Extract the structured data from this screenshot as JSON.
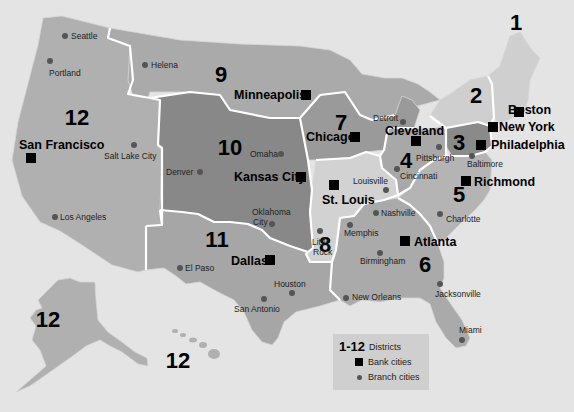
{
  "map": {
    "title_implied": "Federal Reserve Districts",
    "colors": {
      "background": "#e4e4e4",
      "d1": "#cfcfcf",
      "d2": "#cfcfcf",
      "d3": "#8a8a8a",
      "d4": "#a8a8a8",
      "d5": "#b4b4b4",
      "d6": "#aaaaaa",
      "d7": "#9a9a9a",
      "d8": "#d2d2d2",
      "d9": "#aaaaaa",
      "d10": "#888888",
      "d11": "#a6a6a6",
      "d12": "#b0b0b0",
      "border": "#ffffff",
      "bank_marker": "#000000",
      "branch_marker": "#555555"
    },
    "districts": [
      {
        "num": "1",
        "x": 516,
        "y": 30
      },
      {
        "num": "2",
        "x": 476,
        "y": 103
      },
      {
        "num": "3",
        "x": 459,
        "y": 150
      },
      {
        "num": "4",
        "x": 406,
        "y": 168
      },
      {
        "num": "5",
        "x": 459,
        "y": 202
      },
      {
        "num": "6",
        "x": 425,
        "y": 272
      },
      {
        "num": "7",
        "x": 341,
        "y": 130
      },
      {
        "num": "8",
        "x": 325,
        "y": 252
      },
      {
        "num": "9",
        "x": 221,
        "y": 82
      },
      {
        "num": "10",
        "x": 230,
        "y": 155
      },
      {
        "num": "11",
        "x": 217,
        "y": 247
      },
      {
        "num": "12",
        "x": 77,
        "y": 125
      },
      {
        "num": "12",
        "x": 48,
        "y": 327
      },
      {
        "num": "12",
        "x": 178,
        "y": 368
      }
    ],
    "bank_cities": [
      {
        "name": "Boston",
        "x": 519,
        "y": 112,
        "lx": 508,
        "ly": 114,
        "anchor": "start",
        "label_dy": 0
      },
      {
        "name": "New York",
        "x": 493,
        "y": 127,
        "lx": 499,
        "ly": 131,
        "anchor": "start"
      },
      {
        "name": "Philadelphia",
        "x": 481,
        "y": 145,
        "lx": 491,
        "ly": 149,
        "anchor": "start"
      },
      {
        "name": "Cleveland",
        "x": 416,
        "y": 141,
        "lx": 385,
        "ly": 135,
        "anchor": "start"
      },
      {
        "name": "Richmond",
        "x": 466,
        "y": 181,
        "lx": 474,
        "ly": 186,
        "anchor": "start"
      },
      {
        "name": "Atlanta",
        "x": 405,
        "y": 241,
        "lx": 414,
        "ly": 246,
        "anchor": "start"
      },
      {
        "name": "Chicago",
        "x": 355,
        "y": 137,
        "lx": 306,
        "ly": 141,
        "anchor": "start"
      },
      {
        "name": "St. Louis",
        "x": 334,
        "y": 185,
        "lx": 322,
        "ly": 204,
        "anchor": "start"
      },
      {
        "name": "Minneapolis",
        "x": 306,
        "y": 95,
        "lx": 234,
        "ly": 99,
        "anchor": "start"
      },
      {
        "name": "Kansas City",
        "x": 301,
        "y": 177,
        "lx": 234,
        "ly": 181,
        "anchor": "start"
      },
      {
        "name": "Dallas",
        "x": 270,
        "y": 260,
        "lx": 231,
        "ly": 265,
        "anchor": "start"
      },
      {
        "name": "San Francisco",
        "x": 31,
        "y": 158,
        "lx": 19,
        "ly": 149,
        "anchor": "start"
      }
    ],
    "branch_cities": [
      {
        "name": "Seattle",
        "x": 65,
        "y": 36,
        "lx": 71,
        "ly": 39
      },
      {
        "name": "Portland",
        "x": 50,
        "y": 61,
        "lx": 49,
        "ly": 76
      },
      {
        "name": "Helena",
        "x": 145,
        "y": 65,
        "lx": 151,
        "ly": 68
      },
      {
        "name": "Salt Lake City",
        "x": 134,
        "y": 145,
        "lx": 104,
        "ly": 159
      },
      {
        "name": "Los Angeles",
        "x": 55,
        "y": 217,
        "lx": 60,
        "ly": 220
      },
      {
        "name": "Denver",
        "x": 200,
        "y": 172,
        "lx": 166,
        "ly": 175
      },
      {
        "name": "Omaha",
        "x": 281,
        "y": 154,
        "lx": 250,
        "ly": 157
      },
      {
        "name": "Oklahoma City",
        "x": 272,
        "y": 224,
        "lx": 252,
        "ly": 215,
        "lx2": 253,
        "ly2": 225,
        "split": [
          "Oklahoma",
          "City"
        ]
      },
      {
        "name": "El Paso",
        "x": 180,
        "y": 268,
        "lx": 185,
        "ly": 271
      },
      {
        "name": "Houston",
        "x": 292,
        "y": 293,
        "lx": 274,
        "ly": 287
      },
      {
        "name": "San Antonio",
        "x": 264,
        "y": 299,
        "lx": 234,
        "ly": 312
      },
      {
        "name": "Detroit",
        "x": 403,
        "y": 122,
        "lx": 373,
        "ly": 121
      },
      {
        "name": "Pittsburgh",
        "x": 439,
        "y": 147,
        "lx": 416,
        "ly": 161
      },
      {
        "name": "Cincinnati",
        "x": 397,
        "y": 169,
        "lx": 400,
        "ly": 179
      },
      {
        "name": "Baltimore",
        "x": 472,
        "y": 156,
        "lx": 467,
        "ly": 167
      },
      {
        "name": "Louisville",
        "x": 386,
        "y": 190,
        "lx": 353,
        "ly": 184
      },
      {
        "name": "Nashville",
        "x": 376,
        "y": 213,
        "lx": 381,
        "ly": 216
      },
      {
        "name": "Charlotte",
        "x": 440,
        "y": 214,
        "lx": 446,
        "ly": 222
      },
      {
        "name": "Memphis",
        "x": 350,
        "y": 225,
        "lx": 344,
        "ly": 236
      },
      {
        "name": "Little Rock",
        "x": 320,
        "y": 231,
        "lx": 312,
        "ly": 245,
        "lx2": 313,
        "ly2": 255,
        "split": [
          "Little",
          "Rock"
        ]
      },
      {
        "name": "Birmingham",
        "x": 380,
        "y": 253,
        "lx": 360,
        "ly": 264
      },
      {
        "name": "New Orleans",
        "x": 346,
        "y": 298,
        "lx": 352,
        "ly": 300
      },
      {
        "name": "Jacksonville",
        "x": 440,
        "y": 284,
        "lx": 435,
        "ly": 297
      },
      {
        "name": "Miami",
        "x": 462,
        "y": 340,
        "lx": 459,
        "ly": 333
      }
    ],
    "legend": {
      "districts_num": "1-12",
      "districts_label": "Districts",
      "bank_label": "Bank cities",
      "branch_label": "Branch cities"
    }
  }
}
